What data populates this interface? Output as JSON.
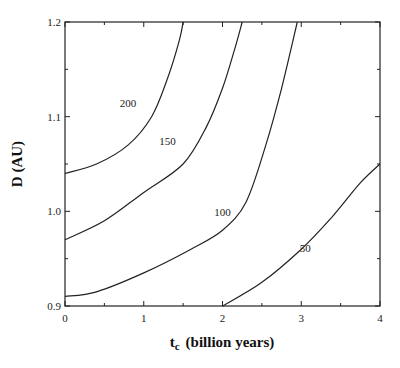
{
  "chart_data": {
    "type": "line",
    "title": "",
    "xlabel": "t_c (billion years)",
    "xlabel_main": "t",
    "xlabel_sub": "c",
    "xlabel_rest": "(billion years)",
    "ylabel": "D (AU)",
    "xlim": [
      0,
      4
    ],
    "ylim": [
      0.9,
      1.2
    ],
    "x_ticks": [
      "0",
      "1",
      "2",
      "3",
      "4"
    ],
    "y_ticks": [
      "0.9",
      "1.0",
      "1.1",
      "1.2"
    ],
    "grid": false,
    "legend": "none (inline curve labels)",
    "series": [
      {
        "name": "200",
        "x": [
          0,
          0.4,
          0.8,
          1.1,
          1.3,
          1.45,
          1.5
        ],
        "y": [
          1.04,
          1.05,
          1.07,
          1.1,
          1.14,
          1.18,
          1.2
        ]
      },
      {
        "name": "150",
        "x": [
          0,
          0.5,
          1.0,
          1.5,
          1.8,
          2.0,
          2.15,
          2.25
        ],
        "y": [
          0.97,
          0.99,
          1.02,
          1.05,
          1.09,
          1.13,
          1.17,
          1.2
        ]
      },
      {
        "name": "100",
        "x": [
          0,
          0.4,
          1.0,
          1.6,
          2.0,
          2.3,
          2.55,
          2.75,
          2.95
        ],
        "y": [
          0.91,
          0.915,
          0.935,
          0.96,
          0.98,
          1.01,
          1.07,
          1.13,
          1.2
        ]
      },
      {
        "name": "50",
        "x": [
          2.0,
          2.5,
          3.0,
          3.4,
          3.75,
          4.0
        ],
        "y": [
          0.9,
          0.925,
          0.96,
          0.995,
          1.03,
          1.05
        ]
      }
    ],
    "annotations": [
      {
        "text": "200",
        "x": 0.8,
        "y": 1.11
      },
      {
        "text": "150",
        "x": 1.3,
        "y": 1.07
      },
      {
        "text": "100",
        "x": 2.0,
        "y": 0.995
      },
      {
        "text": "50",
        "x": 3.05,
        "y": 0.957
      }
    ]
  }
}
